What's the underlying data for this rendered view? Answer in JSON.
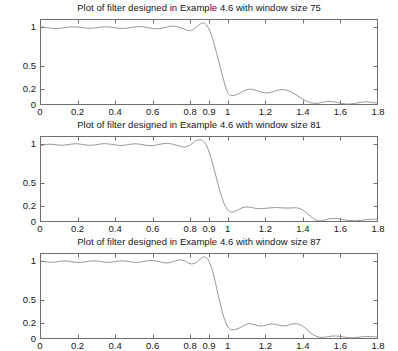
{
  "figure": {
    "background_color": "#ffffff",
    "line_color": "#8a8a8a",
    "axis_color": "#6e6e6e",
    "text_color": "#151515"
  },
  "chart_data": [
    {
      "type": "line",
      "title": "Plot of filter designed in Example 4.6 with window size 75",
      "xlabel": "",
      "ylabel": "",
      "xlim": [
        0,
        1.8
      ],
      "ylim": [
        0,
        1.1
      ],
      "grid": false,
      "legend": null,
      "xticks": [
        0,
        0.2,
        0.4,
        0.6,
        0.8,
        0.9,
        1,
        1.2,
        1.4,
        1.6,
        1.8
      ],
      "xtick_labels": [
        "0",
        "0.2",
        "0.4",
        "0.6",
        "0.8",
        "0.9",
        "1",
        "1.2",
        "1.4",
        "1.6",
        "1.8"
      ],
      "yticks": [
        0,
        0.2,
        0.5,
        1
      ],
      "ytick_labels": [
        "0",
        "0.2",
        "0.5",
        "1"
      ],
      "series": [
        {
          "name": "magnitude response",
          "x": [
            0,
            0.02,
            0.05,
            0.08,
            0.11,
            0.14,
            0.17,
            0.2,
            0.23,
            0.26,
            0.29,
            0.32,
            0.35,
            0.38,
            0.41,
            0.44,
            0.47,
            0.5,
            0.53,
            0.56,
            0.59,
            0.62,
            0.65,
            0.68,
            0.71,
            0.74,
            0.77,
            0.8,
            0.83,
            0.86,
            0.88,
            0.9,
            0.92,
            0.94,
            0.96,
            0.98,
            1.0,
            1.02,
            1.05,
            1.08,
            1.11,
            1.14,
            1.17,
            1.2,
            1.23,
            1.26,
            1.29,
            1.32,
            1.35,
            1.38,
            1.41,
            1.44,
            1.47,
            1.5,
            1.53,
            1.56,
            1.59,
            1.62,
            1.65,
            1.68,
            1.71,
            1.74,
            1.77,
            1.8
          ],
          "y": [
            1.0,
            0.995,
            0.985,
            0.978,
            0.982,
            0.993,
            1.0,
            0.997,
            0.988,
            0.981,
            0.985,
            0.995,
            1.0,
            0.995,
            0.985,
            0.979,
            0.984,
            0.996,
            1.003,
            0.996,
            0.983,
            0.975,
            0.982,
            1.0,
            1.01,
            0.995,
            0.968,
            0.952,
            0.99,
            1.045,
            1.04,
            0.97,
            0.84,
            0.67,
            0.48,
            0.3,
            0.155,
            0.12,
            0.135,
            0.175,
            0.2,
            0.195,
            0.17,
            0.155,
            0.163,
            0.185,
            0.197,
            0.185,
            0.15,
            0.105,
            0.06,
            0.03,
            0.02,
            0.032,
            0.045,
            0.042,
            0.028,
            0.015,
            0.012,
            0.022,
            0.035,
            0.04,
            0.032,
            0.02
          ]
        }
      ]
    },
    {
      "type": "line",
      "title": "Plot of filter designed in Example 4.6 with window size 81",
      "xlabel": "",
      "ylabel": "",
      "xlim": [
        0,
        1.8
      ],
      "ylim": [
        0,
        1.1
      ],
      "grid": false,
      "legend": null,
      "xticks": [
        0,
        0.2,
        0.4,
        0.6,
        0.8,
        0.9,
        1,
        1.2,
        1.4,
        1.6,
        1.8
      ],
      "xtick_labels": [
        "0",
        "0.2",
        "0.4",
        "0.6",
        "0.8",
        "0.9",
        "1",
        "1.2",
        "1.4",
        "1.6",
        "1.8"
      ],
      "yticks": [
        0,
        0.2,
        0.5,
        1
      ],
      "ytick_labels": [
        "0",
        "0.2",
        "0.5",
        "1"
      ],
      "series": [
        {
          "name": "magnitude response",
          "x": [
            0,
            0.02,
            0.05,
            0.08,
            0.11,
            0.14,
            0.17,
            0.2,
            0.23,
            0.26,
            0.29,
            0.32,
            0.35,
            0.38,
            0.41,
            0.44,
            0.47,
            0.5,
            0.53,
            0.56,
            0.59,
            0.62,
            0.65,
            0.68,
            0.71,
            0.74,
            0.77,
            0.8,
            0.83,
            0.86,
            0.88,
            0.9,
            0.92,
            0.94,
            0.96,
            0.98,
            1.0,
            1.02,
            1.05,
            1.08,
            1.11,
            1.14,
            1.17,
            1.2,
            1.23,
            1.26,
            1.29,
            1.32,
            1.35,
            1.38,
            1.41,
            1.44,
            1.47,
            1.5,
            1.53,
            1.56,
            1.59,
            1.62,
            1.65,
            1.68,
            1.71,
            1.74,
            1.77,
            1.8
          ],
          "y": [
            0.972,
            0.985,
            0.995,
            0.99,
            0.982,
            0.986,
            0.997,
            1.0,
            0.99,
            0.981,
            0.985,
            0.997,
            1.002,
            0.993,
            0.982,
            0.98,
            0.99,
            1.0,
            0.996,
            0.983,
            0.976,
            0.985,
            1.0,
            1.005,
            0.993,
            0.973,
            0.958,
            0.985,
            1.04,
            1.048,
            1.005,
            0.9,
            0.74,
            0.56,
            0.38,
            0.24,
            0.155,
            0.125,
            0.15,
            0.185,
            0.192,
            0.178,
            0.17,
            0.175,
            0.182,
            0.185,
            0.18,
            0.178,
            0.182,
            0.175,
            0.135,
            0.075,
            0.025,
            0.015,
            0.035,
            0.045,
            0.04,
            0.028,
            0.018,
            0.016,
            0.022,
            0.03,
            0.034,
            0.038
          ]
        }
      ]
    },
    {
      "type": "line",
      "title": "Plot of filter designed in Example 4.6 with window size 87",
      "xlabel": "",
      "ylabel": "",
      "xlim": [
        0,
        1.8
      ],
      "ylim": [
        0,
        1.1
      ],
      "grid": false,
      "legend": null,
      "xticks": [
        0,
        0.2,
        0.4,
        0.6,
        0.8,
        0.9,
        1,
        1.2,
        1.4,
        1.6,
        1.8
      ],
      "xtick_labels": [
        "0",
        "0.2",
        "0.4",
        "0.6",
        "0.8",
        "0.9",
        "1",
        "1.2",
        "1.4",
        "1.6",
        "1.8"
      ],
      "yticks": [
        0,
        0.2,
        0.5,
        1
      ],
      "ytick_labels": [
        "0",
        "0.2",
        "0.5",
        "1"
      ],
      "series": [
        {
          "name": "magnitude response",
          "x": [
            0,
            0.02,
            0.05,
            0.08,
            0.11,
            0.14,
            0.17,
            0.2,
            0.23,
            0.26,
            0.29,
            0.32,
            0.35,
            0.38,
            0.41,
            0.44,
            0.47,
            0.5,
            0.53,
            0.56,
            0.59,
            0.62,
            0.65,
            0.68,
            0.71,
            0.74,
            0.77,
            0.8,
            0.83,
            0.86,
            0.88,
            0.9,
            0.92,
            0.94,
            0.96,
            0.98,
            1.0,
            1.02,
            1.05,
            1.08,
            1.11,
            1.14,
            1.17,
            1.2,
            1.23,
            1.26,
            1.29,
            1.32,
            1.35,
            1.38,
            1.41,
            1.44,
            1.47,
            1.5,
            1.53,
            1.56,
            1.59,
            1.62,
            1.65,
            1.68,
            1.71,
            1.74,
            1.77,
            1.8
          ],
          "y": [
            1.0,
            0.992,
            0.982,
            0.985,
            0.996,
            0.998,
            0.988,
            0.979,
            0.983,
            0.995,
            1.0,
            0.992,
            0.981,
            0.982,
            0.994,
            1.0,
            0.992,
            0.981,
            0.982,
            0.995,
            1.005,
            0.997,
            0.98,
            0.973,
            0.99,
            1.012,
            1.0,
            0.962,
            0.975,
            1.035,
            1.048,
            0.995,
            0.86,
            0.66,
            0.45,
            0.27,
            0.155,
            0.12,
            0.128,
            0.165,
            0.195,
            0.185,
            0.165,
            0.175,
            0.192,
            0.185,
            0.168,
            0.175,
            0.195,
            0.188,
            0.145,
            0.08,
            0.035,
            0.02,
            0.028,
            0.038,
            0.035,
            0.024,
            0.016,
            0.018,
            0.026,
            0.032,
            0.03,
            0.024
          ]
        }
      ]
    }
  ],
  "panels": [
    {
      "title": "Plot of filter designed in Example 4.6 with window size 75"
    },
    {
      "title": "Plot of filter designed in Example 4.6 with window size 81"
    },
    {
      "title": "Plot of filter designed in Example 4.6 with window size 87"
    }
  ]
}
